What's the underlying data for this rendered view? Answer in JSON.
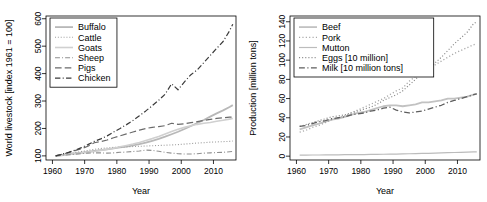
{
  "figure": {
    "panels": [
      "world-livestock",
      "production"
    ]
  },
  "chart_data": [
    {
      "id": "world-livestock",
      "type": "line",
      "title": "",
      "xlabel": "Year",
      "ylabel": "World livestock [index 1961 = 100]",
      "xlim": [
        1958,
        2017
      ],
      "ylim": [
        85,
        610
      ],
      "xticks": [
        1960,
        1970,
        1980,
        1990,
        2000,
        2010
      ],
      "yticks": [
        100,
        200,
        300,
        400,
        500,
        600
      ],
      "grid": false,
      "legend_position": "top-left",
      "x": [
        1961,
        1963,
        1965,
        1967,
        1969,
        1971,
        1973,
        1975,
        1977,
        1979,
        1981,
        1983,
        1985,
        1987,
        1989,
        1991,
        1993,
        1995,
        1997,
        1999,
        2001,
        2003,
        2005,
        2007,
        2009,
        2011,
        2013,
        2015,
        2016
      ],
      "series": [
        {
          "name": "Buffalo",
          "style": "solid",
          "color": "#b8b8b8",
          "width": 1.8,
          "values": [
            100,
            103,
            106,
            109,
            112,
            115,
            118,
            121,
            124,
            127,
            131,
            134,
            138,
            143,
            148,
            155,
            162,
            170,
            179,
            188,
            198,
            209,
            220,
            231,
            243,
            255,
            266,
            278,
            285
          ]
        },
        {
          "name": "Cattle",
          "style": "dotted",
          "color": "#9a9a9a",
          "width": 1.1,
          "values": [
            100,
            104,
            108,
            112,
            116,
            120,
            124,
            127,
            129,
            131,
            132,
            133,
            134,
            135,
            136,
            137,
            138,
            139,
            140,
            141,
            143,
            145,
            147,
            148,
            150,
            151,
            152,
            153,
            154
          ]
        },
        {
          "name": "Goats",
          "style": "solid",
          "color": "#d0d0d0",
          "width": 1.6,
          "values": [
            100,
            102,
            105,
            108,
            110,
            113,
            116,
            120,
            124,
            128,
            133,
            138,
            143,
            149,
            156,
            163,
            171,
            180,
            189,
            197,
            204,
            210,
            215,
            219,
            222,
            226,
            230,
            234,
            236
          ]
        },
        {
          "name": "Sheep",
          "style": "dashdot",
          "color": "#8f8f8f",
          "width": 1.1,
          "values": [
            100,
            102,
            104,
            106,
            108,
            110,
            111,
            111,
            110,
            111,
            113,
            114,
            116,
            118,
            121,
            120,
            117,
            113,
            110,
            108,
            107,
            107,
            108,
            110,
            111,
            112,
            113,
            115,
            116
          ]
        },
        {
          "name": "Pigs",
          "style": "longdash",
          "color": "#6a6a6a",
          "width": 1.2,
          "values": [
            100,
            106,
            112,
            119,
            126,
            135,
            148,
            152,
            158,
            166,
            173,
            180,
            187,
            194,
            200,
            204,
            207,
            210,
            219,
            215,
            217,
            221,
            225,
            229,
            233,
            237,
            239,
            241,
            242
          ]
        },
        {
          "name": "Chicken",
          "style": "dashdot",
          "color": "#3a3a3a",
          "width": 1.2,
          "values": [
            100,
            106,
            113,
            121,
            130,
            141,
            153,
            162,
            173,
            187,
            200,
            214,
            229,
            246,
            264,
            283,
            303,
            325,
            363,
            341,
            370,
            396,
            414,
            440,
            466,
            492,
            517,
            556,
            580
          ]
        }
      ]
    },
    {
      "id": "production",
      "type": "line",
      "title": "",
      "xlabel": "Year",
      "ylabel": "Production [million tons]",
      "xlim": [
        1958,
        2017
      ],
      "ylim": [
        -4,
        146
      ],
      "xticks": [
        1960,
        1970,
        1980,
        1990,
        2000,
        2010
      ],
      "yticks": [
        0,
        20,
        40,
        60,
        80,
        100,
        120,
        140
      ],
      "grid": false,
      "legend_position": "top-left",
      "x": [
        1961,
        1963,
        1965,
        1967,
        1969,
        1971,
        1973,
        1975,
        1977,
        1979,
        1981,
        1983,
        1985,
        1987,
        1989,
        1991,
        1993,
        1995,
        1997,
        1999,
        2001,
        2003,
        2005,
        2007,
        2009,
        2011,
        2013,
        2015,
        2016
      ],
      "series": [
        {
          "name": "Beef",
          "style": "solid",
          "color": "#c2c2c2",
          "width": 1.8,
          "values": [
            28,
            30,
            32,
            34,
            36,
            38,
            39,
            41,
            43,
            45,
            46,
            48,
            50,
            52,
            53,
            53,
            52,
            53,
            54,
            56,
            56,
            57,
            58,
            60,
            60,
            61,
            62,
            64,
            65
          ]
        },
        {
          "name": "Pork",
          "style": "dotted",
          "color": "#a8a8a8",
          "width": 1.3,
          "values": [
            25,
            27,
            30,
            32,
            35,
            38,
            40,
            42,
            45,
            48,
            51,
            54,
            57,
            60,
            64,
            68,
            71,
            78,
            83,
            88,
            91,
            95,
            99,
            103,
            107,
            110,
            113,
            116,
            117
          ]
        },
        {
          "name": "Mutton",
          "style": "solid",
          "color": "#bcbcbc",
          "width": 1.2,
          "values": [
            1.0,
            1.1,
            1.2,
            1.2,
            1.3,
            1.4,
            1.4,
            1.5,
            1.5,
            1.6,
            1.7,
            1.8,
            1.9,
            2.0,
            2.1,
            2.2,
            2.3,
            2.5,
            2.6,
            2.8,
            3.0,
            3.2,
            3.4,
            3.6,
            3.8,
            4.0,
            4.2,
            4.4,
            4.5
          ]
        },
        {
          "name": "Eggs [10 million]",
          "style": "dotted",
          "color": "#8a8a8a",
          "width": 1.2,
          "values": [
            31,
            33,
            35,
            37,
            39,
            41,
            42,
            43,
            45,
            47,
            49,
            51,
            54,
            58,
            61,
            64,
            68,
            74,
            80,
            87,
            92,
            97,
            103,
            110,
            117,
            123,
            129,
            138,
            140
          ]
        },
        {
          "name": "Milk [10 million tons]",
          "style": "dashdot",
          "color": "#5e5e5e",
          "width": 1.3,
          "values": [
            31,
            32,
            34,
            36,
            37,
            39,
            40,
            41,
            43,
            44,
            45,
            47,
            48,
            50,
            51,
            48,
            46,
            45,
            46,
            47,
            49,
            51,
            53,
            56,
            58,
            60,
            62,
            64,
            65
          ]
        }
      ]
    }
  ]
}
